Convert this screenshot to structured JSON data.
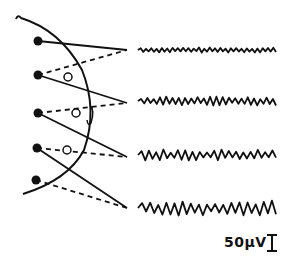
{
  "diagram": {
    "colors": {
      "ink": "#111111",
      "background": "#ffffff"
    },
    "electrodes": [
      {
        "id": "e1",
        "x": 38,
        "y": 41
      },
      {
        "id": "e2",
        "x": 38,
        "y": 75
      },
      {
        "id": "e3",
        "x": 38,
        "y": 113
      },
      {
        "id": "e4",
        "x": 37,
        "y": 148
      },
      {
        "id": "e5",
        "x": 36,
        "y": 180
      }
    ],
    "reference_circles": [
      {
        "x": 68,
        "y": 77
      },
      {
        "x": 76,
        "y": 113
      },
      {
        "x": 67,
        "y": 150
      }
    ],
    "channels": [
      {
        "index": 1,
        "pair": [
          "e1",
          "e2"
        ],
        "apex_y": 50,
        "trace_y": 50,
        "amplitude": 2,
        "cycles": 26
      },
      {
        "index": 2,
        "pair": [
          "e2",
          "e3"
        ],
        "apex_y": 103,
        "trace_y": 101,
        "amplitude": 3.5,
        "cycles": 22
      },
      {
        "index": 3,
        "pair": [
          "e3",
          "e4"
        ],
        "apex_y": 157,
        "trace_y": 155,
        "amplitude": 4.5,
        "cycles": 19
      },
      {
        "index": 4,
        "pair": [
          "e4",
          "e5"
        ],
        "apex_y": 208,
        "trace_y": 208,
        "amplitude": 6,
        "cycles": 17
      }
    ],
    "scale_bar": {
      "label": "50µV",
      "symbol": "I"
    }
  }
}
